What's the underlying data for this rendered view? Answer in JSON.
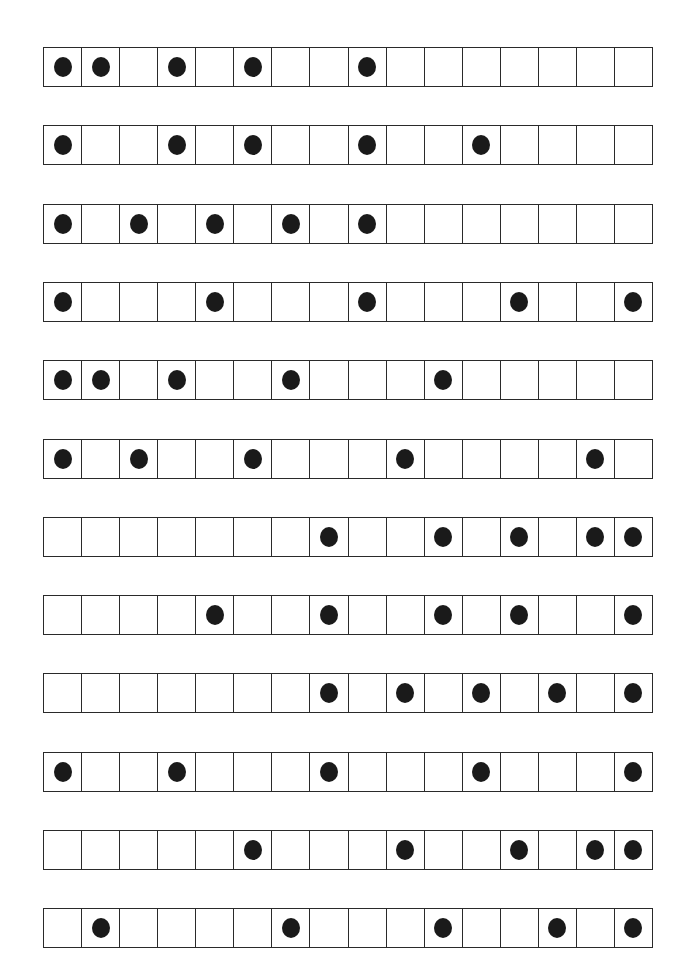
{
  "figure": {
    "cells_per_row": 16,
    "row_pitch_px": 78.3,
    "dot_color": "#1a1a1a",
    "line_color": "#2a2a2a",
    "rows": [
      {
        "dots": [
          1,
          2,
          4,
          6,
          9
        ]
      },
      {
        "dots": [
          1,
          4,
          6,
          9,
          12
        ]
      },
      {
        "dots": [
          1,
          3,
          5,
          7,
          9
        ]
      },
      {
        "dots": [
          1,
          5,
          9,
          13,
          16
        ]
      },
      {
        "dots": [
          1,
          2,
          4,
          7,
          11
        ]
      },
      {
        "dots": [
          1,
          3,
          6,
          10,
          15
        ]
      },
      {
        "dots": [
          8,
          11,
          13,
          15,
          16
        ]
      },
      {
        "dots": [
          5,
          8,
          11,
          13,
          16
        ]
      },
      {
        "dots": [
          8,
          10,
          12,
          14,
          16
        ]
      },
      {
        "dots": [
          1,
          4,
          8,
          12,
          16
        ]
      },
      {
        "dots": [
          6,
          10,
          13,
          15,
          16
        ]
      },
      {
        "dots": [
          2,
          7,
          11,
          14,
          16
        ]
      }
    ]
  }
}
